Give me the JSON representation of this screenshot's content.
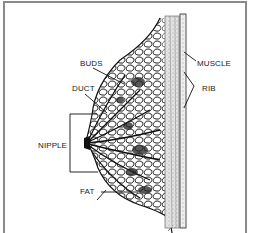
{
  "diagram": {
    "labels": {
      "buds": "BUDS",
      "duct": "DUCT",
      "nipple": "NIPPLE",
      "fat": "FAT",
      "muscle": "MUSCLE",
      "rib": "RIB"
    },
    "colors": {
      "line": "#1a1a1a",
      "frame": "#8a8a8a",
      "muscle_fill": "#d9d9d9",
      "background": "#ffffff"
    }
  }
}
